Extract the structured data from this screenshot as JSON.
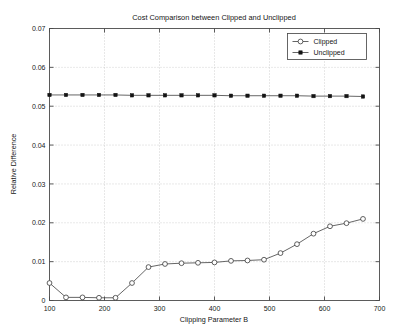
{
  "chart_data": {
    "type": "line",
    "title": "Cost Comparison between Clipped and Unclipped",
    "xlabel": "Clipping Parameter B",
    "ylabel": "Relative Difference",
    "xlim": [
      100,
      700
    ],
    "ylim": [
      0,
      0.07
    ],
    "grid": true,
    "legend_position": "upper right",
    "xticks": [
      100,
      200,
      300,
      400,
      500,
      600,
      700
    ],
    "xtick_labels": [
      "100",
      "200",
      "300",
      "400",
      "500",
      "600",
      "700"
    ],
    "yticks": [
      0,
      0.01,
      0.02,
      0.03,
      0.04,
      0.05,
      0.06,
      0.07
    ],
    "ytick_labels": [
      "0",
      "0.01",
      "0.02",
      "0.03",
      "0.04",
      "0.05",
      "0.06",
      "0.07"
    ],
    "x": [
      100,
      130,
      160,
      190,
      220,
      250,
      280,
      310,
      340,
      370,
      400,
      430,
      460,
      490,
      520,
      550,
      580,
      610,
      640,
      670
    ],
    "series": [
      {
        "name": "Clipped",
        "marker": "open-circle",
        "color": "#3a3a3a",
        "values": [
          0.0045,
          0.0008,
          0.0008,
          0.0007,
          0.0007,
          0.0045,
          0.0086,
          0.0094,
          0.0096,
          0.0097,
          0.0098,
          0.0102,
          0.0103,
          0.0105,
          0.0122,
          0.0145,
          0.0172,
          0.0191,
          0.0199,
          0.021
        ]
      },
      {
        "name": "Unclipped",
        "marker": "filled-square",
        "color": "#141414",
        "values": [
          0.0529,
          0.0529,
          0.0529,
          0.0529,
          0.0529,
          0.0528,
          0.0528,
          0.0528,
          0.0528,
          0.0528,
          0.0528,
          0.0527,
          0.0527,
          0.0527,
          0.0527,
          0.0527,
          0.0526,
          0.0526,
          0.0526,
          0.0525
        ]
      }
    ]
  },
  "legend": {
    "entries": [
      {
        "label": "Clipped",
        "marker": "open-circle"
      },
      {
        "label": "Unclipped",
        "marker": "filled-square"
      }
    ]
  }
}
